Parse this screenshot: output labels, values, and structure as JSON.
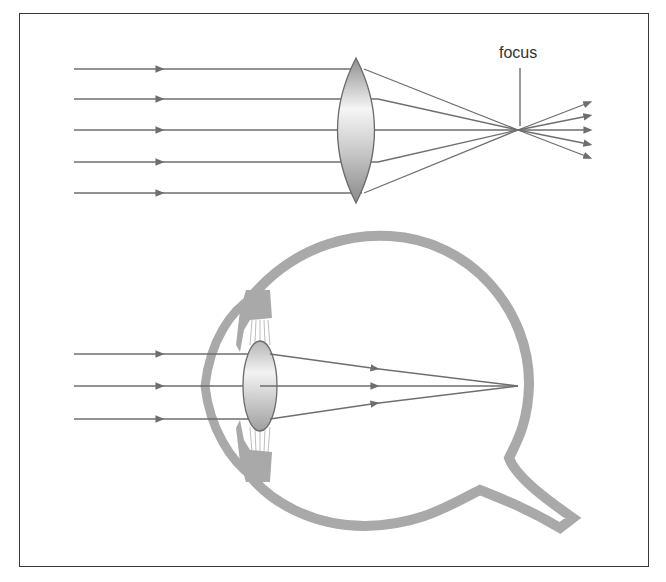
{
  "figure": {
    "top_panel": {
      "title": "Convex lens focusing parallel rays",
      "focus_label": "focus",
      "rays_in_y": [
        69,
        98,
        130,
        162,
        192
      ],
      "lens": {
        "cx": 355,
        "top": 57,
        "bottom": 203,
        "half_width": 24
      },
      "focus_point": {
        "x": 518,
        "y": 130
      },
      "rays_out_end_y": [
        104,
        117,
        130,
        143,
        156
      ]
    },
    "bottom_panel": {
      "title": "Human eye focusing parallel rays on retina",
      "rays_in_y": [
        354,
        386,
        419
      ],
      "lens": {
        "cx": 260,
        "cy": 386,
        "rx": 17,
        "ry": 45
      },
      "focus_point": {
        "x": 518,
        "y": 386
      }
    },
    "colors": {
      "frame": "#3a3a3a",
      "ray": "#6e6e6e",
      "eye_wall": "#a9a9a9",
      "lens_light": "#f2f2f2",
      "lens_dark": "#9a9a9a"
    }
  }
}
